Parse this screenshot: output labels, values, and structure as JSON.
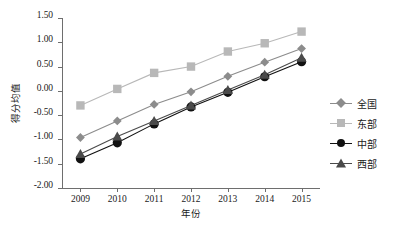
{
  "chart_data": {
    "type": "line",
    "title": "",
    "xlabel": "年份",
    "ylabel": "得分均值",
    "categories": [
      "2009",
      "2010",
      "2011",
      "2012",
      "2013",
      "2014",
      "2015"
    ],
    "ylim": [
      -2.0,
      1.5
    ],
    "yticks": [
      "1.50",
      "1.00",
      "0.50",
      "0.00",
      "-0.50",
      "-1.00",
      "-1.50",
      "-2.00"
    ],
    "ytick_values": [
      1.5,
      1.0,
      0.5,
      0.0,
      -0.5,
      -1.0,
      -1.5,
      -2.0
    ],
    "grid": false,
    "legend_position": "right",
    "series": [
      {
        "name": "全国",
        "marker": "diamond",
        "color": "#8c8c8c",
        "values": [
          -0.96,
          -0.62,
          -0.28,
          -0.02,
          0.3,
          0.59,
          0.87
        ]
      },
      {
        "name": "东部",
        "marker": "square",
        "color": "#b8b8b8",
        "values": [
          -0.3,
          0.04,
          0.37,
          0.5,
          0.81,
          0.98,
          1.22
        ]
      },
      {
        "name": "中部",
        "marker": "circle",
        "color": "#111111",
        "values": [
          -1.4,
          -1.07,
          -0.68,
          -0.33,
          -0.03,
          0.29,
          0.6
        ]
      },
      {
        "name": "西部",
        "marker": "triangle",
        "color": "#4a4a4a",
        "values": [
          -1.3,
          -0.94,
          -0.62,
          -0.3,
          0.02,
          0.33,
          0.68
        ]
      }
    ]
  },
  "axis": {
    "line_color": "#6e6e6e",
    "text_color": "#1a1a1a"
  }
}
